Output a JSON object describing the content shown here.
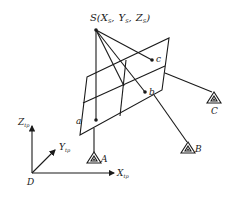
{
  "diagram": {
    "projection_center": {
      "name": "S",
      "label_main": "S(",
      "coords": [
        {
          "symbol": "X",
          "sub": "S"
        },
        {
          "symbol": "Y",
          "sub": "S"
        },
        {
          "symbol": "Z",
          "sub": "S"
        }
      ],
      "separator": ",",
      "close": ")"
    },
    "image_points": [
      "a",
      "b",
      "c"
    ],
    "ground_control_points": [
      "A",
      "B",
      "C"
    ],
    "axes": {
      "origin": "D",
      "x": {
        "symbol": "X",
        "sub": "tp"
      },
      "y": {
        "symbol": "Y",
        "sub": "tp"
      },
      "z": {
        "symbol": "Z",
        "sub": "tp"
      }
    },
    "colors": {
      "ink": "#1a1a1a",
      "background": "#ffffff"
    }
  }
}
